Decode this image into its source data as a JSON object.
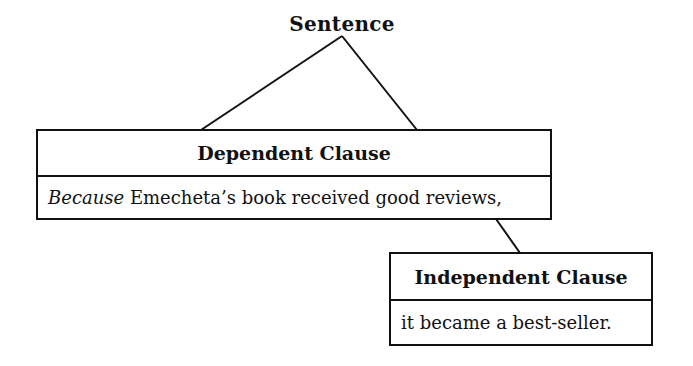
{
  "diagram": {
    "root": {
      "label": "Sentence"
    },
    "nodes": [
      {
        "id": "dependent",
        "title": "Dependent Clause",
        "text_italic": "Because",
        "text_rest": " Emecheta’s book received good reviews,"
      },
      {
        "id": "independent",
        "title": "Independent Clause",
        "text": "it became a best-seller."
      }
    ],
    "edges": [
      {
        "from": "Sentence",
        "to": "Dependent Clause"
      },
      {
        "from": "Sentence",
        "to": "Dependent Clause"
      },
      {
        "from": "Dependent Clause",
        "to": "Independent Clause"
      }
    ],
    "colors": {
      "line": "#111111",
      "background": "#ffffff"
    }
  }
}
